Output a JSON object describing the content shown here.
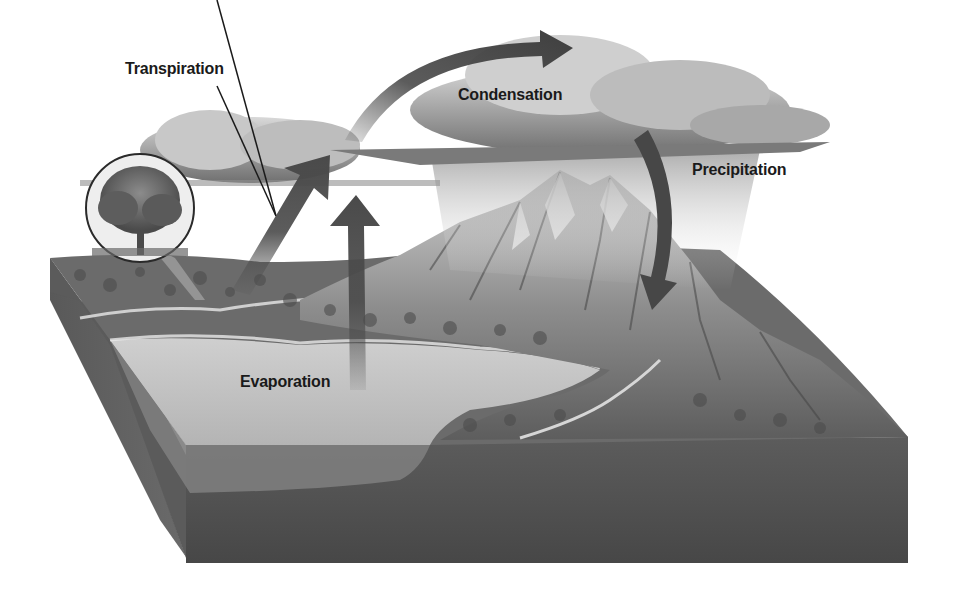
{
  "diagram": {
    "labels": {
      "transpiration": "Transpiration",
      "condensation": "Condensation",
      "precipitation": "Precipitation",
      "evaporation": "Evaporation"
    },
    "elements": [
      {
        "id": "tree-inset",
        "description": "Circular inset showing a deciduous tree"
      },
      {
        "id": "transpiration-arrow",
        "description": "Diagonal arrow rising from land toward clouds"
      },
      {
        "id": "evaporation-arrow",
        "description": "Vertical arrow rising from lake toward clouds"
      },
      {
        "id": "condensation-arrow",
        "description": "Curved arrow arcing over the clouds to the right"
      },
      {
        "id": "precipitation-arrow",
        "description": "Curved arrow descending from cloud to mountain"
      },
      {
        "id": "clouds",
        "description": "Storm clouds with rain over the mountains"
      },
      {
        "id": "mountains",
        "description": "Rocky mountain range with a river"
      },
      {
        "id": "lake",
        "description": "Lake in the foreground of the terrain block"
      },
      {
        "id": "ground-block",
        "description": "Cross-section block of soil and land"
      }
    ],
    "colors": {
      "arrow": "#4a4a4a",
      "cloud": "#9a9a9a",
      "soil": "#555555",
      "water": "#bdbdbd",
      "land": "#6e6e6e",
      "label_text": "#1a1a1a"
    }
  }
}
